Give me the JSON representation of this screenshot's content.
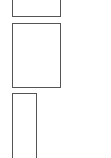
{
  "thumbnails": [
    {
      "name": "page-thumbnail-1",
      "x": 12,
      "y": -2,
      "w": 49,
      "h": 19
    },
    {
      "name": "page-thumbnail-2",
      "x": 12,
      "y": 23,
      "w": 49,
      "h": 65
    },
    {
      "name": "page-thumbnail-3",
      "x": 12,
      "y": 93,
      "w": 25,
      "h": 66
    }
  ],
  "colors": {
    "border": "#555555",
    "background": "#ffffff"
  }
}
